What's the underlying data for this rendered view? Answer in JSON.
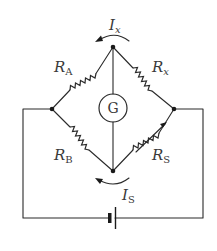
{
  "diagram": {
    "labels": {
      "RA": {
        "main": "R",
        "sub": "A"
      },
      "Rx": {
        "main": "R",
        "sub": "x"
      },
      "RB": {
        "main": "R",
        "sub": "B"
      },
      "RS": {
        "main": "R",
        "sub": "S"
      },
      "Ix": {
        "main": "I",
        "sub": "x"
      },
      "IS": {
        "main": "I",
        "sub": "S"
      },
      "galvanometer": "G"
    },
    "components": [
      {
        "id": "RA",
        "type": "resistor",
        "position": "top-left arm"
      },
      {
        "id": "Rx",
        "type": "resistor",
        "position": "top-right arm"
      },
      {
        "id": "RB",
        "type": "resistor",
        "position": "bottom-left arm"
      },
      {
        "id": "RS",
        "type": "variable-resistor",
        "position": "bottom-right arm"
      },
      {
        "id": "G",
        "type": "galvanometer",
        "position": "center, between top and bottom nodes"
      },
      {
        "id": "battery",
        "type": "battery",
        "position": "bottom wire"
      }
    ],
    "currents": [
      {
        "id": "Ix",
        "direction": "counter-clockwise arc above top node"
      },
      {
        "id": "IS",
        "direction": "counter-clockwise arc below bottom node"
      }
    ]
  }
}
